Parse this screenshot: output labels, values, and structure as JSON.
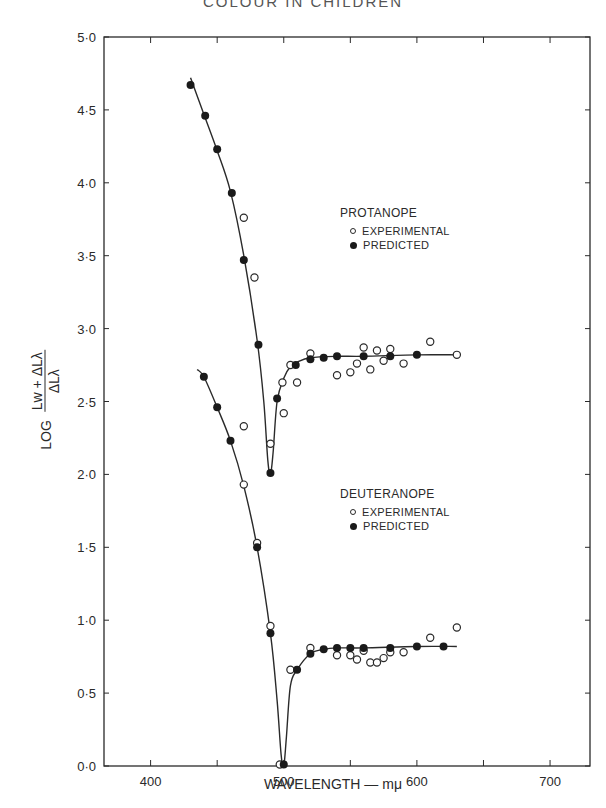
{
  "header_fragment": "COLOUR IN CHILDREN",
  "chart_data": {
    "type": "scatter",
    "title": "",
    "xlabel": "WAVELENGTH — mμ",
    "ylabel": "LOG (Lw + ΔLλ) / ΔLλ",
    "ylabel_parts": {
      "prefix": "LOG",
      "numerator": "Lw + ΔLλ",
      "denominator": "ΔLλ"
    },
    "xlim": [
      365,
      730
    ],
    "ylim": [
      0,
      5
    ],
    "xticks": [
      400,
      500,
      600,
      700
    ],
    "xticks_minor": [
      450,
      550,
      650
    ],
    "yticks": [
      "0·0",
      "0·5",
      "1·0",
      "1·5",
      "2·0",
      "2·5",
      "3·0",
      "3·5",
      "4·0",
      "4·5",
      "5·0"
    ],
    "ytick_values": [
      0,
      0.5,
      1.0,
      1.5,
      2.0,
      2.5,
      3.0,
      3.5,
      4.0,
      4.5,
      5.0
    ],
    "grid": false,
    "groups": [
      {
        "name": "PROTANOPE",
        "legend": {
          "title": "PROTANOPE",
          "experimental": "EXPERIMENTAL",
          "predicted": "PREDICTED"
        },
        "curve": [
          [
            430,
            4.72
          ],
          [
            440,
            4.47
          ],
          [
            450,
            4.22
          ],
          [
            460,
            3.94
          ],
          [
            470,
            3.5
          ],
          [
            480,
            2.92
          ],
          [
            485,
            2.5
          ],
          [
            488,
            2.1
          ],
          [
            490,
            2.0
          ],
          [
            492,
            2.15
          ],
          [
            495,
            2.5
          ],
          [
            500,
            2.66
          ],
          [
            505,
            2.74
          ],
          [
            510,
            2.77
          ],
          [
            520,
            2.8
          ],
          [
            540,
            2.81
          ],
          [
            560,
            2.81
          ],
          [
            600,
            2.82
          ],
          [
            630,
            2.82
          ]
        ],
        "series": [
          {
            "name": "EXPERIMENTAL",
            "marker": "open",
            "x": [
              470,
              478,
              490,
              499,
              500,
              505,
              510,
              520,
              540,
              550,
              555,
              560,
              565,
              570,
              575,
              580,
              590,
              610,
              630
            ],
            "y": [
              3.76,
              3.35,
              2.21,
              2.63,
              2.42,
              2.75,
              2.63,
              2.83,
              2.68,
              2.7,
              2.76,
              2.87,
              2.72,
              2.85,
              2.78,
              2.86,
              2.76,
              2.91,
              2.82
            ]
          },
          {
            "name": "PREDICTED",
            "marker": "filled",
            "x": [
              430,
              441,
              450,
              461,
              470,
              481,
              490,
              495,
              509,
              520,
              530,
              540,
              560,
              580,
              600
            ],
            "y": [
              4.67,
              4.46,
              4.23,
              3.93,
              3.47,
              2.89,
              2.01,
              2.52,
              2.75,
              2.79,
              2.8,
              2.81,
              2.81,
              2.81,
              2.82
            ]
          }
        ]
      },
      {
        "name": "DEUTERANOPE",
        "legend": {
          "title": "DEUTERANOPE",
          "experimental": "EXPERIMENTAL",
          "predicted": "PREDICTED"
        },
        "curve": [
          [
            435,
            2.72
          ],
          [
            440,
            2.67
          ],
          [
            450,
            2.46
          ],
          [
            460,
            2.23
          ],
          [
            470,
            1.92
          ],
          [
            480,
            1.5
          ],
          [
            490,
            0.91
          ],
          [
            495,
            0.45
          ],
          [
            498,
            0.08
          ],
          [
            500,
            0.0
          ],
          [
            502,
            0.2
          ],
          [
            505,
            0.55
          ],
          [
            510,
            0.66
          ],
          [
            520,
            0.77
          ],
          [
            530,
            0.8
          ],
          [
            540,
            0.81
          ],
          [
            560,
            0.81
          ],
          [
            600,
            0.82
          ],
          [
            630,
            0.82
          ]
        ],
        "series": [
          {
            "name": "EXPERIMENTAL",
            "marker": "open",
            "x": [
              470,
              470,
              480,
              490,
              497,
              505,
              520,
              540,
              550,
              555,
              560,
              565,
              570,
              575,
              580,
              590,
              610,
              630
            ],
            "y": [
              2.33,
              1.93,
              1.53,
              0.96,
              0.01,
              0.66,
              0.81,
              0.76,
              0.76,
              0.73,
              0.79,
              0.71,
              0.71,
              0.74,
              0.78,
              0.78,
              0.88,
              0.95
            ]
          },
          {
            "name": "PREDICTED",
            "marker": "filled",
            "x": [
              440,
              450,
              460,
              480,
              490,
              500,
              510,
              520,
              530,
              540,
              550,
              560,
              580,
              600,
              620
            ],
            "y": [
              2.67,
              2.46,
              2.23,
              1.5,
              0.91,
              0.01,
              0.66,
              0.77,
              0.8,
              0.81,
              0.81,
              0.81,
              0.81,
              0.82,
              0.82
            ]
          }
        ]
      }
    ]
  }
}
